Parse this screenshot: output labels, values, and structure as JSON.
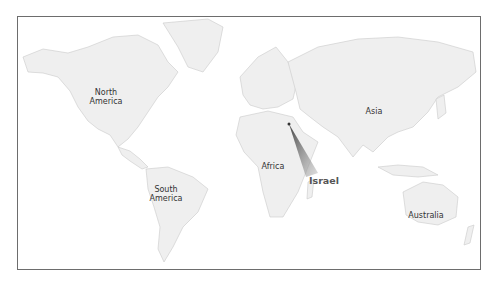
{
  "map": {
    "type": "world-outline",
    "highlight_country": "Israel",
    "colors": {
      "land": "#efefef",
      "border": "#c9c9c9",
      "frame": "#6d6d6d",
      "callout": "#555555"
    },
    "continents": [
      {
        "id": "north-america",
        "line1": "North",
        "line2": "America"
      },
      {
        "id": "south-america",
        "line1": "South",
        "line2": "America"
      },
      {
        "id": "africa",
        "line1": "Africa"
      },
      {
        "id": "asia",
        "line1": "Asia"
      },
      {
        "id": "australia",
        "line1": "Australia"
      }
    ],
    "callout_label": "Israel"
  }
}
